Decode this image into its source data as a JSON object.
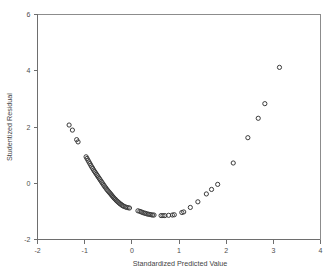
{
  "chart_data": {
    "type": "scatter",
    "title": "",
    "xlabel": "Standardized Predicted Value",
    "ylabel": "Studentized Residual",
    "xlim": [
      -2,
      4
    ],
    "ylim": [
      -2,
      6
    ],
    "xticks": [
      -2,
      -1,
      0,
      1,
      2,
      3,
      4
    ],
    "yticks": [
      -2,
      0,
      2,
      4,
      6
    ],
    "xtick_labels": [
      "-2",
      "-1",
      "0",
      "1",
      "2",
      "3",
      "4"
    ],
    "ytick_labels": [
      "-2",
      "0",
      "2",
      "4",
      "6"
    ],
    "grid": false,
    "legend": null,
    "marker": "open-circle",
    "marker_color": "#3a3a3a",
    "points": [
      {
        "x": -1.33,
        "y": 2.07
      },
      {
        "x": -1.26,
        "y": 1.89
      },
      {
        "x": -1.17,
        "y": 1.55
      },
      {
        "x": -1.14,
        "y": 1.47
      },
      {
        "x": -0.97,
        "y": 0.94
      },
      {
        "x": -0.95,
        "y": 0.88
      },
      {
        "x": -0.93,
        "y": 0.82
      },
      {
        "x": -0.91,
        "y": 0.76
      },
      {
        "x": -0.89,
        "y": 0.7
      },
      {
        "x": -0.87,
        "y": 0.64
      },
      {
        "x": -0.85,
        "y": 0.58
      },
      {
        "x": -0.83,
        "y": 0.53
      },
      {
        "x": -0.81,
        "y": 0.47
      },
      {
        "x": -0.79,
        "y": 0.42
      },
      {
        "x": -0.77,
        "y": 0.37
      },
      {
        "x": -0.75,
        "y": 0.32
      },
      {
        "x": -0.73,
        "y": 0.27
      },
      {
        "x": -0.71,
        "y": 0.22
      },
      {
        "x": -0.69,
        "y": 0.17
      },
      {
        "x": -0.67,
        "y": 0.12
      },
      {
        "x": -0.65,
        "y": 0.07
      },
      {
        "x": -0.63,
        "y": 0.02
      },
      {
        "x": -0.61,
        "y": -0.03
      },
      {
        "x": -0.59,
        "y": -0.08
      },
      {
        "x": -0.57,
        "y": -0.13
      },
      {
        "x": -0.55,
        "y": -0.17
      },
      {
        "x": -0.53,
        "y": -0.22
      },
      {
        "x": -0.51,
        "y": -0.26
      },
      {
        "x": -0.49,
        "y": -0.3
      },
      {
        "x": -0.47,
        "y": -0.34
      },
      {
        "x": -0.45,
        "y": -0.38
      },
      {
        "x": -0.43,
        "y": -0.42
      },
      {
        "x": -0.41,
        "y": -0.46
      },
      {
        "x": -0.39,
        "y": -0.5
      },
      {
        "x": -0.37,
        "y": -0.54
      },
      {
        "x": -0.35,
        "y": -0.57
      },
      {
        "x": -0.33,
        "y": -0.61
      },
      {
        "x": -0.31,
        "y": -0.64
      },
      {
        "x": -0.29,
        "y": -0.67
      },
      {
        "x": -0.27,
        "y": -0.7
      },
      {
        "x": -0.25,
        "y": -0.73
      },
      {
        "x": -0.23,
        "y": -0.75
      },
      {
        "x": -0.21,
        "y": -0.78
      },
      {
        "x": -0.19,
        "y": -0.8
      },
      {
        "x": -0.17,
        "y": -0.82
      },
      {
        "x": -0.14,
        "y": -0.84
      },
      {
        "x": -0.11,
        "y": -0.86
      },
      {
        "x": -0.08,
        "y": -0.87
      },
      {
        "x": -0.05,
        "y": -0.88
      },
      {
        "x": 0.13,
        "y": -0.98
      },
      {
        "x": 0.17,
        "y": -1.0
      },
      {
        "x": 0.2,
        "y": -1.02
      },
      {
        "x": 0.23,
        "y": -1.04
      },
      {
        "x": 0.26,
        "y": -1.06
      },
      {
        "x": 0.29,
        "y": -1.07
      },
      {
        "x": 0.32,
        "y": -1.09
      },
      {
        "x": 0.35,
        "y": -1.1
      },
      {
        "x": 0.38,
        "y": -1.11
      },
      {
        "x": 0.41,
        "y": -1.12
      },
      {
        "x": 0.44,
        "y": -1.13
      },
      {
        "x": 0.47,
        "y": -1.13
      },
      {
        "x": 0.62,
        "y": -1.15
      },
      {
        "x": 0.66,
        "y": -1.15
      },
      {
        "x": 0.7,
        "y": -1.15
      },
      {
        "x": 0.78,
        "y": -1.14
      },
      {
        "x": 0.86,
        "y": -1.13
      },
      {
        "x": 0.9,
        "y": -1.12
      },
      {
        "x": 1.06,
        "y": -1.04
      },
      {
        "x": 1.1,
        "y": -1.02
      },
      {
        "x": 1.24,
        "y": -0.86
      },
      {
        "x": 1.4,
        "y": -0.66
      },
      {
        "x": 1.58,
        "y": -0.38
      },
      {
        "x": 1.69,
        "y": -0.22
      },
      {
        "x": 1.82,
        "y": -0.04
      },
      {
        "x": 2.15,
        "y": 0.72
      },
      {
        "x": 2.46,
        "y": 1.62
      },
      {
        "x": 2.68,
        "y": 2.31
      },
      {
        "x": 2.82,
        "y": 2.83
      },
      {
        "x": 3.13,
        "y": 4.12
      }
    ]
  },
  "accessibility": {
    "chart_role": "scatterplot",
    "description_label": "residual-plot"
  }
}
